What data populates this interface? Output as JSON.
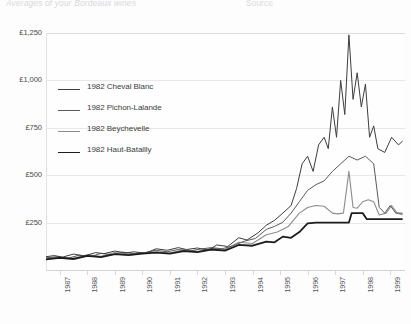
{
  "header": {
    "faded_title": "Averages of your Bordeaux wines",
    "faded_right": "Source"
  },
  "chart_data": {
    "type": "line",
    "title": "",
    "xlabel": "",
    "ylabel": "",
    "ylim": [
      0,
      1250
    ],
    "yticks": [
      250,
      500,
      750,
      1000,
      1250
    ],
    "ytick_labels": [
      "£250",
      "£500",
      "£750",
      "£1,000",
      "£1,250"
    ],
    "grid": true,
    "legend_position": "upper-left-inside",
    "currency": "GBP",
    "categories": [
      "1987",
      "1988",
      "1989",
      "1990",
      "1991",
      "1992",
      "1993",
      "1994",
      "1995",
      "1996",
      "1997",
      "1998",
      "1999"
    ],
    "x": [
      1987,
      1988,
      1989,
      1990,
      1991,
      1992,
      1993,
      1994,
      1995,
      1996,
      1997,
      1998,
      1999
    ],
    "series": [
      {
        "name": "1982 Cheval Blanc",
        "color": "#3d3d3d",
        "width": 1.0,
        "values": [
          70,
          78,
          95,
          88,
          110,
          105,
          140,
          175,
          290,
          560,
          840,
          1090,
          680
        ],
        "points": [
          [
            1987.0,
            70
          ],
          [
            1987.3,
            76
          ],
          [
            1987.6,
            68
          ],
          [
            1988.0,
            84
          ],
          [
            1988.4,
            74
          ],
          [
            1988.8,
            92
          ],
          [
            1989.1,
            86
          ],
          [
            1989.5,
            100
          ],
          [
            1989.9,
            90
          ],
          [
            1990.2,
            96
          ],
          [
            1990.6,
            88
          ],
          [
            1991.0,
            112
          ],
          [
            1991.4,
            104
          ],
          [
            1991.8,
            118
          ],
          [
            1992.1,
            108
          ],
          [
            1992.5,
            116
          ],
          [
            1992.9,
            104
          ],
          [
            1993.2,
            132
          ],
          [
            1993.6,
            124
          ],
          [
            1994.0,
            170
          ],
          [
            1994.3,
            158
          ],
          [
            1994.7,
            196
          ],
          [
            1995.0,
            236
          ],
          [
            1995.3,
            262
          ],
          [
            1995.6,
            300
          ],
          [
            1995.9,
            340
          ],
          [
            1996.1,
            430
          ],
          [
            1996.3,
            560
          ],
          [
            1996.5,
            600
          ],
          [
            1996.7,
            520
          ],
          [
            1996.9,
            660
          ],
          [
            1997.1,
            700
          ],
          [
            1997.25,
            640
          ],
          [
            1997.4,
            860
          ],
          [
            1997.55,
            700
          ],
          [
            1997.7,
            1000
          ],
          [
            1997.85,
            820
          ],
          [
            1998.0,
            1240
          ],
          [
            1998.15,
            900
          ],
          [
            1998.3,
            1040
          ],
          [
            1998.45,
            860
          ],
          [
            1998.6,
            980
          ],
          [
            1998.75,
            700
          ],
          [
            1998.9,
            760
          ],
          [
            1999.05,
            640
          ],
          [
            1999.3,
            620
          ],
          [
            1999.55,
            700
          ],
          [
            1999.8,
            660
          ],
          [
            1999.95,
            680
          ]
        ]
      },
      {
        "name": "1982 Pichon-Lalande",
        "color": "#5a5a5a",
        "width": 1.0,
        "values": [
          65,
          72,
          84,
          80,
          100,
          98,
          120,
          150,
          250,
          430,
          560,
          600,
          300
        ],
        "points": [
          [
            1987.0,
            64
          ],
          [
            1987.4,
            70
          ],
          [
            1987.8,
            62
          ],
          [
            1988.2,
            78
          ],
          [
            1988.6,
            70
          ],
          [
            1989.0,
            88
          ],
          [
            1989.4,
            80
          ],
          [
            1989.8,
            94
          ],
          [
            1990.2,
            86
          ],
          [
            1990.6,
            92
          ],
          [
            1991.0,
            104
          ],
          [
            1991.4,
            96
          ],
          [
            1991.8,
            108
          ],
          [
            1992.2,
            100
          ],
          [
            1992.6,
            110
          ],
          [
            1993.0,
            118
          ],
          [
            1993.4,
            112
          ],
          [
            1993.8,
            128
          ],
          [
            1994.2,
            152
          ],
          [
            1994.6,
            166
          ],
          [
            1995.0,
            214
          ],
          [
            1995.3,
            230
          ],
          [
            1995.6,
            252
          ],
          [
            1995.9,
            300
          ],
          [
            1996.2,
            360
          ],
          [
            1996.5,
            420
          ],
          [
            1996.8,
            450
          ],
          [
            1997.1,
            470
          ],
          [
            1997.4,
            520
          ],
          [
            1997.7,
            560
          ],
          [
            1998.0,
            600
          ],
          [
            1998.3,
            580
          ],
          [
            1998.6,
            600
          ],
          [
            1998.9,
            560
          ],
          [
            1999.1,
            330
          ],
          [
            1999.3,
            300
          ],
          [
            1999.5,
            340
          ],
          [
            1999.7,
            300
          ],
          [
            1999.95,
            300
          ]
        ]
      },
      {
        "name": "1982 Beychevelle",
        "color": "#8c8c8c",
        "width": 1.1,
        "values": [
          62,
          70,
          80,
          76,
          96,
          94,
          112,
          140,
          200,
          330,
          370,
          420,
          290
        ],
        "points": [
          [
            1987.0,
            60
          ],
          [
            1987.5,
            68
          ],
          [
            1988.0,
            62
          ],
          [
            1988.5,
            80
          ],
          [
            1989.0,
            72
          ],
          [
            1989.5,
            92
          ],
          [
            1990.0,
            84
          ],
          [
            1990.5,
            90
          ],
          [
            1991.0,
            96
          ],
          [
            1991.5,
            90
          ],
          [
            1992.0,
            106
          ],
          [
            1992.5,
            98
          ],
          [
            1993.0,
            114
          ],
          [
            1993.5,
            108
          ],
          [
            1994.0,
            146
          ],
          [
            1994.5,
            140
          ],
          [
            1995.0,
            186
          ],
          [
            1995.4,
            200
          ],
          [
            1995.8,
            230
          ],
          [
            1996.2,
            300
          ],
          [
            1996.5,
            330
          ],
          [
            1996.8,
            340
          ],
          [
            1997.1,
            336
          ],
          [
            1997.4,
            300
          ],
          [
            1997.6,
            296
          ],
          [
            1997.8,
            300
          ],
          [
            1998.0,
            520
          ],
          [
            1998.15,
            330
          ],
          [
            1998.3,
            326
          ],
          [
            1998.5,
            360
          ],
          [
            1998.7,
            370
          ],
          [
            1998.9,
            360
          ],
          [
            1999.1,
            290
          ],
          [
            1999.35,
            300
          ],
          [
            1999.55,
            340
          ],
          [
            1999.75,
            300
          ],
          [
            1999.95,
            292
          ]
        ]
      },
      {
        "name": "1982 Haut-Batailly",
        "color": "#1c1c1c",
        "width": 1.8,
        "values": [
          58,
          66,
          76,
          72,
          92,
          90,
          106,
          132,
          180,
          250,
          250,
          300,
          270
        ],
        "points": [
          [
            1987.0,
            56
          ],
          [
            1987.5,
            64
          ],
          [
            1988.0,
            58
          ],
          [
            1988.5,
            74
          ],
          [
            1989.0,
            68
          ],
          [
            1989.5,
            84
          ],
          [
            1990.0,
            78
          ],
          [
            1990.5,
            86
          ],
          [
            1991.0,
            92
          ],
          [
            1991.5,
            86
          ],
          [
            1992.0,
            100
          ],
          [
            1992.5,
            94
          ],
          [
            1993.0,
            108
          ],
          [
            1993.5,
            102
          ],
          [
            1994.0,
            132
          ],
          [
            1994.5,
            128
          ],
          [
            1995.0,
            150
          ],
          [
            1995.3,
            146
          ],
          [
            1995.6,
            176
          ],
          [
            1995.9,
            170
          ],
          [
            1996.2,
            200
          ],
          [
            1996.5,
            246
          ],
          [
            1996.8,
            250
          ],
          [
            1997.2,
            250
          ],
          [
            1997.6,
            250
          ],
          [
            1998.0,
            250
          ],
          [
            1998.1,
            300
          ],
          [
            1998.3,
            300
          ],
          [
            1998.5,
            300
          ],
          [
            1998.65,
            268
          ],
          [
            1999.0,
            268
          ],
          [
            1999.4,
            268
          ],
          [
            1999.95,
            268
          ]
        ]
      }
    ]
  }
}
